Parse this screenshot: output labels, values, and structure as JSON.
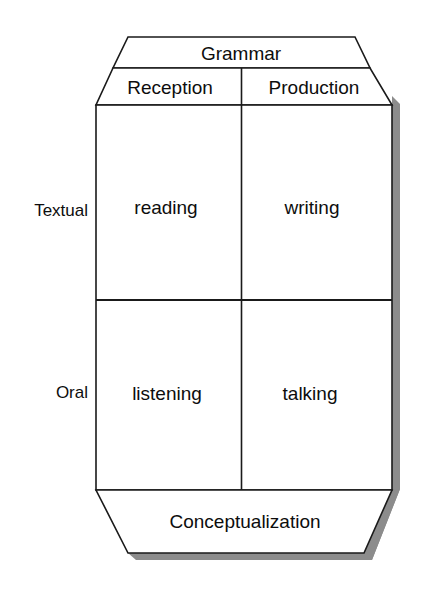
{
  "diagram": {
    "title_band": {
      "label": "Grammar"
    },
    "footer_band": {
      "label": "Conceptualization"
    },
    "column_headers": [
      {
        "label": "Reception"
      },
      {
        "label": "Production"
      }
    ],
    "row_headers": [
      {
        "label": "Textual"
      },
      {
        "label": "Oral"
      }
    ],
    "cells": [
      {
        "row": "Textual",
        "column": "Reception",
        "label": "reading"
      },
      {
        "row": "Textual",
        "column": "Production",
        "label": "writing"
      },
      {
        "row": "Oral",
        "column": "Reception",
        "label": "listening"
      },
      {
        "row": "Oral",
        "column": "Production",
        "label": "talking"
      }
    ],
    "colors": {
      "outline": "#1a1a1a",
      "fill": "#ffffff",
      "shadow": "#8c8c8c",
      "text": "#0d0d0d",
      "background": "#ffffff"
    }
  }
}
